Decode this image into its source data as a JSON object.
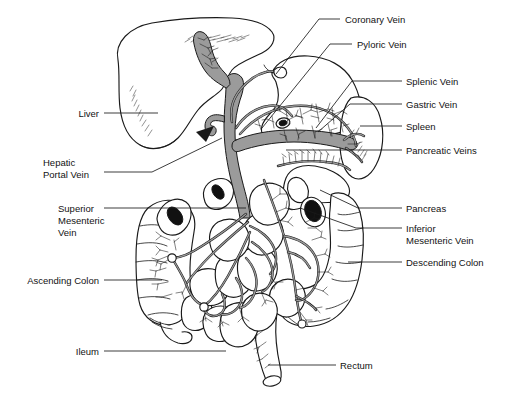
{
  "figure": {
    "width": 505,
    "height": 400,
    "background_color": "#ffffff",
    "line_color": "#1a1a1a",
    "vessel_fill_color": "#9b9b9b",
    "text_color": "#121212"
  },
  "labels": {
    "coronary_vein": "Coronary Vein",
    "pyloric_vein": "Pyloric Vein",
    "splenic_vein": "Splenic Vein",
    "gastric_vein": "Gastric Vein",
    "spleen": "Spleen",
    "pancreatic_veins": "Pancreatic Veins",
    "pancreas": "Pancreas",
    "inferior_mesenteric_vein_line1": "Inferior",
    "inferior_mesenteric_vein_line2": "Mesenteric Vein",
    "descending_colon": "Descending Colon",
    "rectum": "Rectum",
    "liver": "Liver",
    "hepatic_portal_vein_line1": "Hepatic",
    "hepatic_portal_vein_line2": "Portal Vein",
    "superior_mesenteric_vein_line1": "Superior",
    "superior_mesenteric_vein_line2": "Mesenteric",
    "superior_mesenteric_vein_line3": "Vein",
    "ascending_colon": "Ascending Colon",
    "ileum": "Ileum"
  },
  "structures": [
    {
      "name": "liver",
      "side": "left",
      "type": "organ"
    },
    {
      "name": "stomach",
      "side": "center",
      "type": "organ"
    },
    {
      "name": "spleen",
      "side": "right",
      "type": "organ"
    },
    {
      "name": "pancreas",
      "side": "right",
      "type": "organ"
    },
    {
      "name": "ascending-colon",
      "side": "left",
      "type": "organ"
    },
    {
      "name": "descending-colon",
      "side": "right",
      "type": "organ"
    },
    {
      "name": "ileum",
      "side": "center",
      "type": "organ"
    },
    {
      "name": "rectum",
      "side": "center",
      "type": "organ"
    },
    {
      "name": "hepatic-portal-vein",
      "side": "center",
      "type": "vessel"
    },
    {
      "name": "superior-mesenteric-vein",
      "side": "left",
      "type": "vessel"
    },
    {
      "name": "inferior-mesenteric-vein",
      "side": "right",
      "type": "vessel"
    },
    {
      "name": "splenic-vein",
      "side": "right",
      "type": "vessel"
    },
    {
      "name": "gastric-vein",
      "side": "right",
      "type": "vessel"
    },
    {
      "name": "coronary-vein",
      "side": "center",
      "type": "vessel"
    },
    {
      "name": "pyloric-vein",
      "side": "center",
      "type": "vessel"
    },
    {
      "name": "pancreatic-veins",
      "side": "right",
      "type": "vessel"
    }
  ]
}
